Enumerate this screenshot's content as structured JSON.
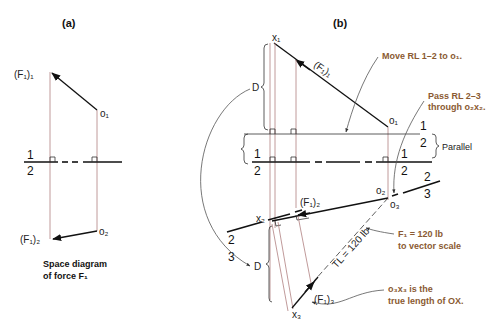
{
  "panel_a": {
    "title": "(a)",
    "labels": {
      "f1_top": "(F₁)₁",
      "o1": "o₁",
      "f1_bottom": "(F₁)₂",
      "o2": "o₂",
      "rl_top": "1",
      "rl_bottom": "2"
    },
    "caption_line1": "Space diagram",
    "caption_line2": "of force F₁"
  },
  "panel_b": {
    "title": "(b)",
    "labels": {
      "x1": "x₁",
      "f1_1": "(F₁)₁",
      "o1": "o₁",
      "d_upper": "D",
      "d_lower": "D",
      "parallel": "Parallel",
      "rl12_upper_1": "1",
      "rl12_upper_2": "2",
      "rl12_left_1": "1",
      "rl12_left_2": "2",
      "rl12_right_1": "1",
      "rl12_right_2": "2",
      "o2": "o₂",
      "o3": "o₃",
      "rl23_right_2": "2",
      "rl23_right_3": "3",
      "rl23_left_2": "2",
      "rl23_left_3": "3",
      "x2": "x₂",
      "f1_2": "(F₁)₂",
      "tl": "TL = 120 lb",
      "f1_3": "(F₁)₃",
      "x3": "x₃"
    },
    "notes": {
      "move_rl": "Move RL 1–2 to o₁.",
      "pass_rl_line1": "Pass RL 2–3",
      "pass_rl_line2": "through o₂x₂.",
      "f1_scale_line1": "F₁ = 120 lb",
      "f1_scale_line2": "to vector scale",
      "true_length_line1": "o₃x₃ is the",
      "true_length_line2": "true length of OX."
    }
  },
  "colors": {
    "note_text": "#8a5a32",
    "projection_line": "#b08080",
    "ink": "#111111"
  }
}
